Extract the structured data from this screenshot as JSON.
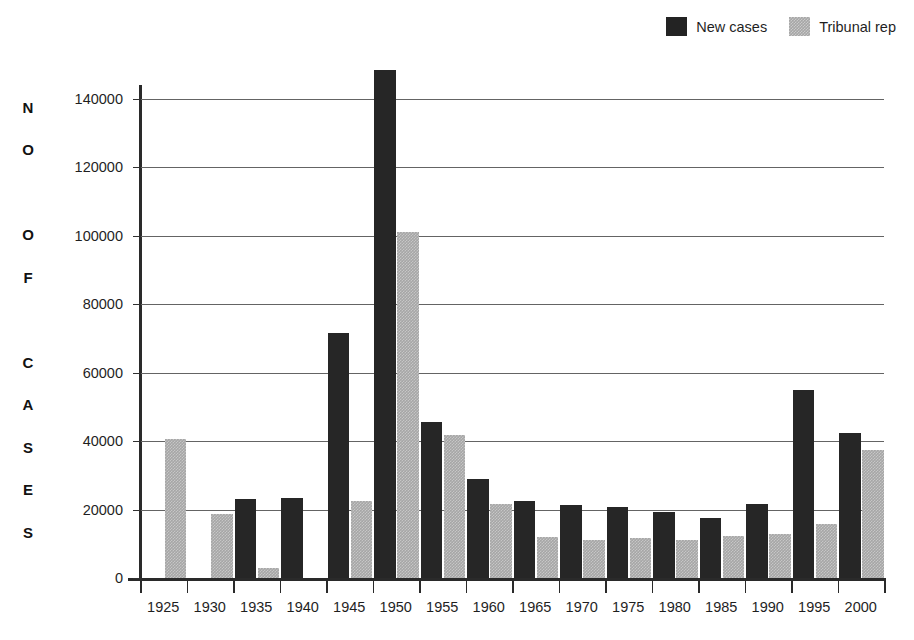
{
  "legend": {
    "items": [
      {
        "label": "New cases",
        "color": "#262626",
        "swatch": "dark"
      },
      {
        "label": "Tribunal rep",
        "color": "#a6a6a6",
        "swatch": "gray"
      }
    ]
  },
  "axis": {
    "y_title_letters": [
      "N",
      "O",
      "",
      "O",
      "F",
      "",
      "C",
      "A",
      "S",
      "E",
      "S"
    ],
    "y_title": "NO OF CASES",
    "y_ticks": [
      0,
      20000,
      40000,
      60000,
      80000,
      100000,
      120000,
      140000
    ],
    "y_tick_labels": [
      "0",
      "20000",
      "40000",
      "60000",
      "80000",
      "100000",
      "120000",
      "140000"
    ]
  },
  "chart_data": {
    "type": "bar",
    "title": "",
    "xlabel": "",
    "ylabel": "NO OF CASES",
    "ylim": [
      0,
      140000
    ],
    "grid": true,
    "legend_position": "top-right",
    "categories": [
      "1925",
      "1930",
      "1935",
      "1940",
      "1945",
      "1950",
      "1955",
      "1960",
      "1965",
      "1970",
      "1975",
      "1980",
      "1985",
      "1990",
      "1995",
      "2000"
    ],
    "series": [
      {
        "name": "New cases",
        "color": "#262626",
        "values": [
          0,
          0,
          23000,
          23500,
          71500,
          148500,
          45500,
          29000,
          22500,
          21300,
          20700,
          19200,
          17400,
          21500,
          55000,
          42500
        ]
      },
      {
        "name": "Tribunal rep",
        "color": "#a6a6a6",
        "values": [
          40500,
          18800,
          3000,
          0,
          22400,
          101000,
          41800,
          21500,
          12000,
          11000,
          11700,
          11200,
          12400,
          12900,
          15900,
          37500
        ]
      }
    ]
  }
}
